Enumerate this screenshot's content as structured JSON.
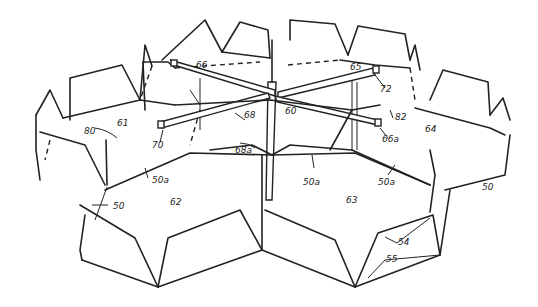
{
  "figure": {
    "type": "patent-drawing",
    "labels": {
      "l50": "50",
      "l50a_left": "50a",
      "l50a_mid": "50a",
      "l50a_right": "50a",
      "l50_right": "50",
      "l54": "54",
      "l55": "55",
      "l60": "60",
      "l61": "61",
      "l62": "62",
      "l63": "63",
      "l64": "64",
      "l65": "65",
      "l66": "66",
      "l66a": "66a",
      "l68": "68",
      "l68a": "68a",
      "l70": "70",
      "l72": "72",
      "l80": "80",
      "l82": "82"
    }
  }
}
